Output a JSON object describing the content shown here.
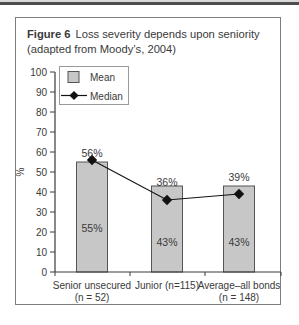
{
  "figure": {
    "title_prefix": "Figure 6",
    "title_rest": "Loss severity depends upon seniority",
    "title_line2": "(adapted from Moody’s, 2004)"
  },
  "chart_data": {
    "type": "bar",
    "categories": [
      "Senior unsecured (n = 52)",
      "Junior (n=115)",
      "Average–all bonds (n = 148)"
    ],
    "category_label_lines": [
      [
        "Senior unsecured",
        "(n = 52)"
      ],
      [
        "Junior (n=115)"
      ],
      [
        "Average–all bonds",
        "(n = 148)"
      ]
    ],
    "series": [
      {
        "name": "Mean",
        "type": "bar",
        "values": [
          55,
          43,
          43
        ],
        "labels": [
          "55%",
          "43%",
          "43%"
        ]
      },
      {
        "name": "Median",
        "type": "line",
        "values": [
          56,
          36,
          39
        ],
        "labels": [
          "56%",
          "36%",
          "39%"
        ]
      }
    ],
    "xlabel": "",
    "ylabel": "%",
    "ylim": [
      0,
      100
    ],
    "yticks": [
      0,
      10,
      20,
      30,
      40,
      50,
      60,
      70,
      80,
      90,
      100
    ],
    "grid": false,
    "legend_position": "top-left"
  },
  "colors": {
    "background": "#ffffff",
    "top_band": "#4e4e4e",
    "top_band_light": "#d9d9d9",
    "box_border": "#7d7d7d",
    "text": "#3a3a3a",
    "axis": "#3a3a3a",
    "bar_fill": "#c7c7c7",
    "bar_border": "#555555",
    "median_color": "#121212",
    "legend_border": "#9a9a9a"
  }
}
